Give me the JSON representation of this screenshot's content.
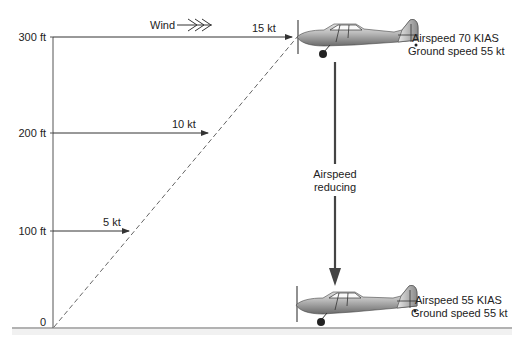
{
  "axis": {
    "ticks": [
      {
        "label": "300 ft",
        "y": 37
      },
      {
        "label": "200 ft",
        "y": 133
      },
      {
        "label": "100 ft",
        "y": 231
      },
      {
        "label": "0",
        "y": 325
      }
    ]
  },
  "wind": {
    "label": "Wind",
    "arrows": [
      {
        "altitude": "300 ft",
        "speed": "15 kt"
      },
      {
        "altitude": "200 ft",
        "speed": "10 kt"
      },
      {
        "altitude": "100 ft",
        "speed": "5 kt"
      }
    ]
  },
  "top_aircraft": {
    "airspeed": "Airspeed  70 KIAS",
    "ground_speed": "Ground speed 55 kt"
  },
  "transition": {
    "line1": "Airspeed",
    "line2": "reducing"
  },
  "bottom_aircraft": {
    "airspeed": "Airspeed  55 KIAS",
    "ground_speed": "Ground speed 55 kt"
  },
  "colors": {
    "line": "#333333",
    "dashed": "#555555",
    "arrow": "#444444",
    "ground": "#666666"
  }
}
